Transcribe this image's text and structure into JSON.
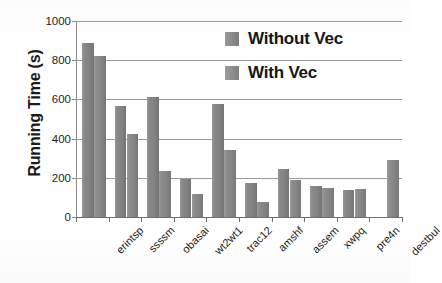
{
  "chart_data": {
    "type": "bar",
    "title": "",
    "xlabel": "",
    "ylabel": "Running Time (s)",
    "ylim": [
      0,
      1000
    ],
    "yticks": [
      0,
      200,
      400,
      600,
      800,
      1000
    ],
    "ytick_labels": [
      "0",
      "200",
      "400",
      "600",
      "800",
      "1000"
    ],
    "grid": true,
    "legend_position": "upper right",
    "categories": [
      "erintsp",
      "ssssm",
      "obasai",
      "wt2wt1",
      "trac12",
      "amshf",
      "assem",
      "xwpq",
      "pre4n",
      "destbul"
    ],
    "series": [
      {
        "name": "Without Vec",
        "color": "#858585",
        "values": [
          890,
          565,
          610,
          193,
          575,
          172,
          245,
          160,
          140,
          0
        ]
      },
      {
        "name": "With Vec",
        "color": "#8a8a8a",
        "values": [
          820,
          425,
          237,
          118,
          342,
          78,
          190,
          150,
          142,
          290
        ]
      }
    ]
  },
  "legend": {
    "items": [
      {
        "label": "Without Vec",
        "swatch": "legend-swatch-without-vec"
      },
      {
        "label": "With Vec",
        "swatch": "legend-swatch-with-vec"
      }
    ]
  },
  "axes": {
    "y_title": "Running Time (s)"
  }
}
